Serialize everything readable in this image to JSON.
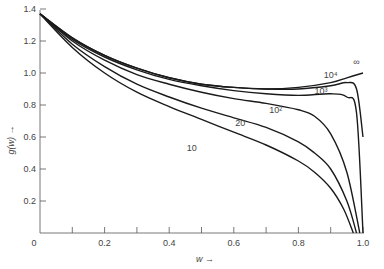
{
  "chart_data": {
    "type": "line",
    "title": "",
    "xlabel": "w →",
    "ylabel": "g(w) →",
    "xlim": [
      0,
      1.0
    ],
    "ylim": [
      0,
      1.4
    ],
    "grid": false,
    "legend": "inline labels near curve ends",
    "x_ticks": [
      "0",
      "0.2",
      "0.4",
      "0.6",
      "0.8",
      "1.0"
    ],
    "x_minor_ticks": [
      0.1,
      0.3,
      0.5,
      0.7,
      0.9
    ],
    "y_ticks": [
      "0.2",
      "0.4",
      "0.6",
      "0.8",
      "1.0",
      "1.2",
      "1.4"
    ],
    "series": [
      {
        "name": "∞",
        "x": [
          0,
          0.1,
          0.2,
          0.3,
          0.4,
          0.5,
          0.6,
          0.7,
          0.8,
          0.9,
          0.95,
          1.0
        ],
        "values": [
          1.37,
          1.22,
          1.11,
          1.03,
          0.97,
          0.93,
          0.91,
          0.9,
          0.91,
          0.94,
          0.97,
          1.0
        ]
      },
      {
        "name": "10⁴",
        "x": [
          0,
          0.1,
          0.2,
          0.3,
          0.4,
          0.5,
          0.6,
          0.7,
          0.8,
          0.9,
          0.95,
          0.98,
          1.0
        ],
        "values": [
          1.37,
          1.22,
          1.11,
          1.03,
          0.97,
          0.93,
          0.91,
          0.9,
          0.9,
          0.92,
          0.94,
          0.9,
          0.6
        ]
      },
      {
        "name": "10³",
        "x": [
          0,
          0.1,
          0.2,
          0.3,
          0.4,
          0.5,
          0.6,
          0.7,
          0.8,
          0.9,
          0.95,
          0.98,
          1.0
        ],
        "values": [
          1.37,
          1.21,
          1.1,
          1.02,
          0.96,
          0.92,
          0.89,
          0.87,
          0.86,
          0.87,
          0.85,
          0.75,
          0.0
        ]
      },
      {
        "name": "10²",
        "x": [
          0,
          0.1,
          0.2,
          0.3,
          0.4,
          0.5,
          0.6,
          0.7,
          0.8,
          0.85,
          0.9,
          0.95,
          0.99
        ],
        "values": [
          1.37,
          1.2,
          1.08,
          0.99,
          0.93,
          0.88,
          0.84,
          0.81,
          0.77,
          0.73,
          0.62,
          0.38,
          0.0
        ]
      },
      {
        "name": "20",
        "x": [
          0,
          0.1,
          0.2,
          0.3,
          0.4,
          0.5,
          0.6,
          0.7,
          0.8,
          0.85,
          0.9,
          0.95,
          0.98
        ],
        "values": [
          1.37,
          1.18,
          1.04,
          0.93,
          0.85,
          0.78,
          0.72,
          0.66,
          0.57,
          0.5,
          0.4,
          0.2,
          0.0
        ]
      },
      {
        "name": "10",
        "x": [
          0,
          0.1,
          0.2,
          0.3,
          0.4,
          0.5,
          0.6,
          0.7,
          0.8,
          0.85,
          0.9,
          0.94,
          0.97
        ],
        "values": [
          1.37,
          1.16,
          1.0,
          0.88,
          0.79,
          0.71,
          0.63,
          0.55,
          0.45,
          0.38,
          0.28,
          0.15,
          0.0
        ]
      }
    ],
    "annotations": [
      {
        "text": "∞",
        "w": 0.98,
        "g": 1.05
      },
      {
        "text": "10⁴",
        "w": 0.9,
        "g": 0.97
      },
      {
        "text": "10³",
        "w": 0.87,
        "g": 0.87
      },
      {
        "text": "10²",
        "w": 0.73,
        "g": 0.75
      },
      {
        "text": "20",
        "w": 0.62,
        "g": 0.67
      },
      {
        "text": "10",
        "w": 0.47,
        "g": 0.51
      }
    ]
  }
}
